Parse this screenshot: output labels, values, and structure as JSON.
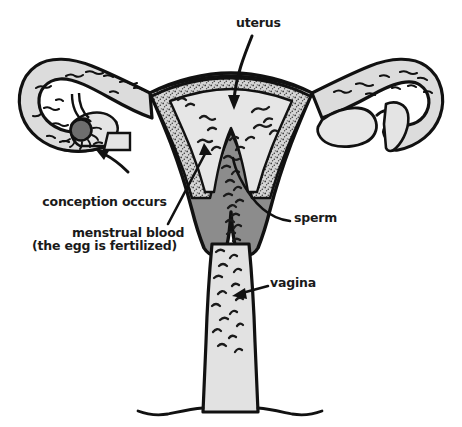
{
  "diagram": {
    "background_color": "#ffffff",
    "outline_color": "#1a1a1a",
    "colors": {
      "myometrium_dark_gray": "#8c8c8c",
      "endometrium_stipple_gray": "#c9c9c9",
      "cavity_light_gray": "#e2e2e2",
      "tube_light_gray": "#dcdcdc",
      "egg_dark_gray": "#6e6e6e",
      "text_black": "#1a1a1a"
    },
    "labels": [
      {
        "id": "uterus",
        "text": "uterus",
        "pointer": "curved-arrow-down-into-uterine-cavity"
      },
      {
        "id": "conception",
        "line1": "conception occurs",
        "line2": "(the egg is fertilized)",
        "pointer": "curved-arrow-up-left-to-ovary"
      },
      {
        "id": "menstrual_blood",
        "text": "menstrual blood",
        "pointer": "straight-arrow-up-right-to-endometrium"
      },
      {
        "id": "sperm",
        "text": "sperm",
        "pointer": "curved-line-to-uterine-cavity-sperm"
      },
      {
        "id": "vagina",
        "text": "vagina",
        "pointer": "straight-arrow-left-to-vaginal-canal"
      }
    ],
    "structures": [
      "uterus",
      "endometrium",
      "myometrium",
      "uterine cavity",
      "left fallopian tube",
      "right fallopian tube",
      "left ovary with egg",
      "right ovary",
      "fimbriae",
      "cervix",
      "vagina"
    ],
    "sperm_count_visible": 60,
    "egg_label": "egg"
  }
}
